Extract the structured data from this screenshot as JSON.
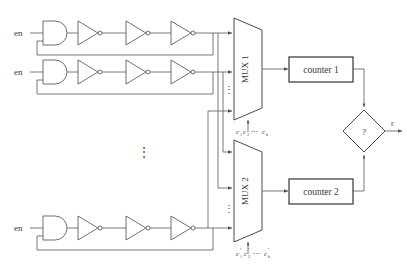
{
  "diagram": {
    "type": "digital-logic-schematic",
    "colors": {
      "wire": "#555555",
      "gate_outline": "#4a4a4a",
      "box_outline": "#333333",
      "text": "#3a3a3a",
      "background": "#ffffff"
    }
  },
  "oscillators": [
    {
      "id": "ro1",
      "enable_label": "en",
      "inverter_count": 3,
      "row": "top"
    },
    {
      "id": "ro2",
      "enable_label": "en",
      "inverter_count": 3,
      "row": "middle"
    },
    {
      "id": "ro3",
      "enable_label": "en",
      "inverter_count": 3,
      "row": "bottom"
    }
  ],
  "vertical_ellipsis": {
    "oscillator_rows": "⋮",
    "mux1_inputs": "⋮",
    "mux2_inputs": "⋮"
  },
  "muxes": [
    {
      "id": "mux1",
      "label": "MUX 1",
      "select_label": "c₁c₂⋯ cₖ",
      "select_parts": {
        "c1": "c",
        "c1sub": "1",
        "c2": "c",
        "c2sub": "2",
        "dots": "⋯",
        "ck": "c",
        "cksub": "k",
        "prime": ""
      }
    },
    {
      "id": "mux2",
      "label": "MUX 2",
      "select_label": "c′₁c′₂⋯ c′ₖ",
      "select_parts": {
        "c1": "c",
        "c1sub": "1",
        "c2": "c",
        "c2sub": "2",
        "dots": "⋯",
        "ck": "c",
        "cksub": "k",
        "prime": "′"
      }
    }
  ],
  "counters": [
    {
      "id": "counter1",
      "label": "counter 1"
    },
    {
      "id": "counter2",
      "label": "counter 2"
    }
  ],
  "comparator": {
    "id": "comparator",
    "label": "?",
    "output_label": "r"
  }
}
